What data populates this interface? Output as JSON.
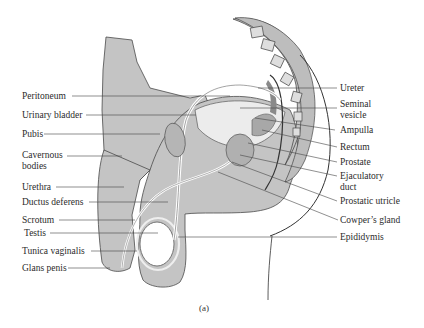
{
  "figure": {
    "caption": "(a)",
    "colors": {
      "tissue": "#c4c4c4",
      "tissue_dark": "#9a9a9a",
      "outline": "#3a3a3a",
      "leader_line": "#444444",
      "background": "#ffffff"
    },
    "left_labels": [
      {
        "id": "peritoneum",
        "text": "Peritoneum"
      },
      {
        "id": "urinary-bladder",
        "text": "Urinary bladder"
      },
      {
        "id": "pubis",
        "text": "Pubis"
      },
      {
        "id": "cavernous-bodies",
        "text": "Cavernous"
      },
      {
        "id": "cavernous-bodies-2",
        "text": "bodies"
      },
      {
        "id": "urethra",
        "text": "Urethra"
      },
      {
        "id": "ductus-deferens",
        "text": "Ductus deferens"
      },
      {
        "id": "scrotum",
        "text": "Scrotum"
      },
      {
        "id": "testis",
        "text": "Testis"
      },
      {
        "id": "tunica-vaginalis",
        "text": "Tunica vaginalis"
      },
      {
        "id": "glans-penis",
        "text": "Glans penis"
      }
    ],
    "right_labels": [
      {
        "id": "ureter",
        "text": "Ureter"
      },
      {
        "id": "seminal-vesicle",
        "text": "Seminal"
      },
      {
        "id": "seminal-vesicle-2",
        "text": "vesicle"
      },
      {
        "id": "ampulla",
        "text": "Ampulla"
      },
      {
        "id": "rectum",
        "text": "Rectum"
      },
      {
        "id": "prostate",
        "text": "Prostate"
      },
      {
        "id": "ejaculatory-duct",
        "text": "Ejaculatory"
      },
      {
        "id": "ejaculatory-duct-2",
        "text": "duct"
      },
      {
        "id": "prostatic-utricle",
        "text": "Prostatic utricle"
      },
      {
        "id": "cowpers-gland",
        "text": "Cowper’s gland"
      },
      {
        "id": "epididymis",
        "text": "Epididymis"
      }
    ]
  }
}
